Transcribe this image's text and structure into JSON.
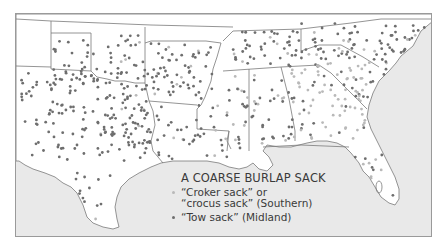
{
  "map": {
    "colors": {
      "land": "#ffffff",
      "water": "#e9e9e9",
      "border": "#7a7a7a",
      "frame": "#9a9a9a"
    },
    "legend": {
      "title": "A COARSE BURLAP SACK",
      "items": [
        {
          "label_line1": "“Croker sack” or",
          "label_line2": "“crocus sack” (Southern)",
          "color": "#b9b9b9",
          "variety": "Southern"
        },
        {
          "label_line1": "“Tow sack” (Midland)",
          "color": "#6e6e6e",
          "variety": "Midland"
        }
      ]
    },
    "regions": [
      "New Mexico edge",
      "Oklahoma",
      "Texas",
      "Arkansas",
      "Louisiana",
      "Mississippi",
      "Alabama",
      "Tennessee",
      "Georgia",
      "South Carolina",
      "North Carolina",
      "Florida"
    ]
  }
}
